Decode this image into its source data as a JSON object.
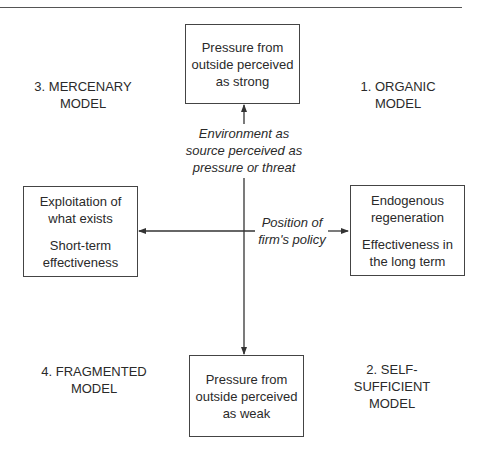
{
  "header": {
    "title_fragment": "...g strategy ... p..."
  },
  "diagram": {
    "top_box": {
      "lines": [
        "Pressure from",
        "outside perceived",
        "as strong"
      ]
    },
    "bottom_box": {
      "lines": [
        "Pressure from",
        "outside perceived",
        "as weak"
      ]
    },
    "left_box": {
      "para1": [
        "Exploitation of",
        "what exists"
      ],
      "para2": [
        "Short-term",
        "effectiveness"
      ]
    },
    "right_box": {
      "para1": [
        "Endogenous",
        "regeneration"
      ],
      "para2": [
        "Effectiveness in",
        "the long term"
      ]
    },
    "vertical_axis_label": [
      "Environment as",
      "source perceived as",
      "pressure or threat"
    ],
    "horizontal_axis_label": [
      "Position of",
      "firm's policy"
    ],
    "quadrants": {
      "top_left": [
        "3. MERCENARY",
        "MODEL"
      ],
      "top_right": [
        "1. ORGANIC",
        "MODEL"
      ],
      "bottom_left": [
        "4. FRAGMENTED",
        "MODEL"
      ],
      "bottom_right": [
        "2. SELF-SUFFICIENT",
        "MODEL"
      ]
    },
    "colors": {
      "line": "#333333",
      "text": "#2a2a2a",
      "border": "#444444"
    }
  }
}
